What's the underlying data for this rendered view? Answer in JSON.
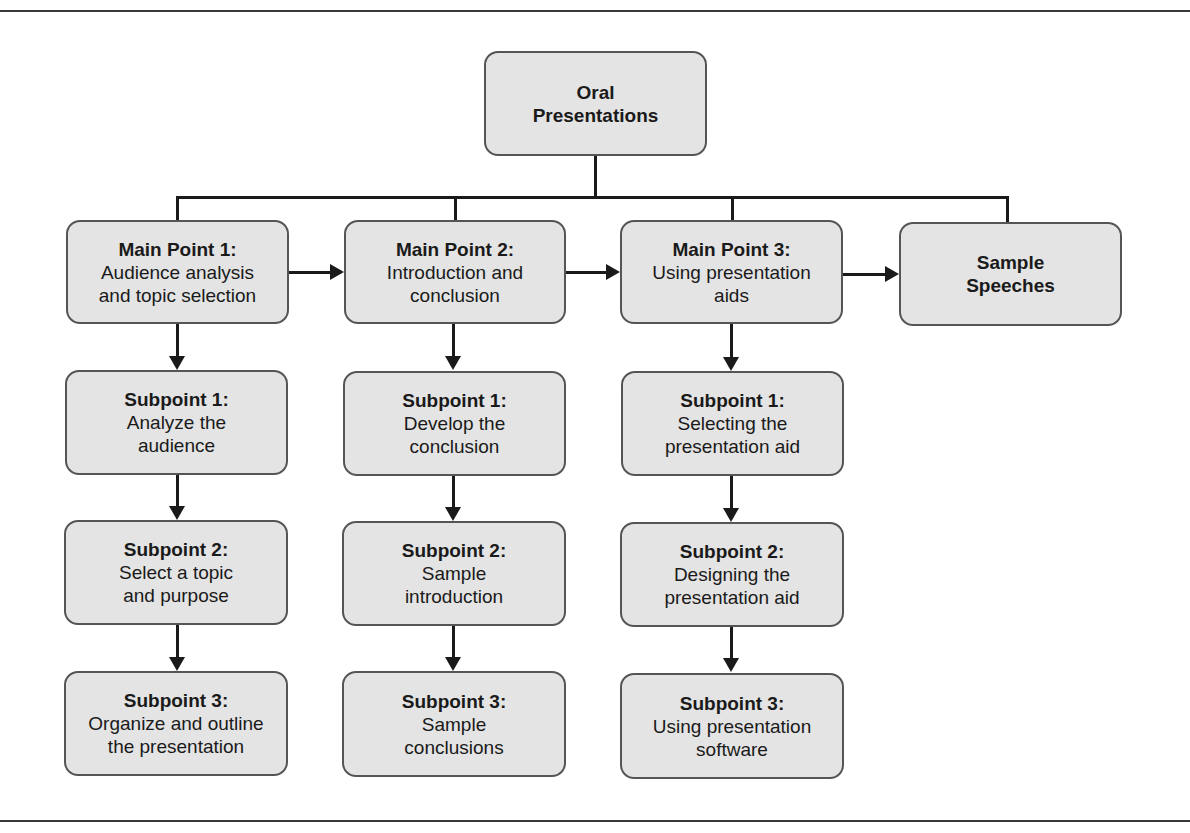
{
  "diagram": {
    "root": {
      "head": "Oral",
      "body": "Presentations"
    },
    "main_points": [
      {
        "head": "Main Point 1:",
        "body": "Audience analysis and topic selection"
      },
      {
        "head": "Main Point 2:",
        "body": "Introduction and conclusion"
      },
      {
        "head": "Main Point 3:",
        "body": "Using presentation aids"
      },
      {
        "head": "Sample",
        "body": "Speeches"
      }
    ],
    "subpoints": [
      [
        {
          "head": "Subpoint 1:",
          "body": "Analyze the audience"
        },
        {
          "head": "Subpoint 2:",
          "body": "Select a topic and purpose"
        },
        {
          "head": "Subpoint 3:",
          "body": "Organize and outline the presentation"
        }
      ],
      [
        {
          "head": "Subpoint 1:",
          "body": "Develop the conclusion"
        },
        {
          "head": "Subpoint 2:",
          "body": "Sample introduction"
        },
        {
          "head": "Subpoint 3:",
          "body": "Sample conclusions"
        }
      ],
      [
        {
          "head": "Subpoint 1:",
          "body": "Selecting the presentation aid"
        },
        {
          "head": "Subpoint 2:",
          "body": "Designing the presentation aid"
        },
        {
          "head": "Subpoint 3:",
          "body": "Using presentation software"
        }
      ]
    ],
    "colors": {
      "box_fill": "#e4e4e4",
      "box_border": "#555555",
      "line": "#1a1a1a"
    }
  }
}
